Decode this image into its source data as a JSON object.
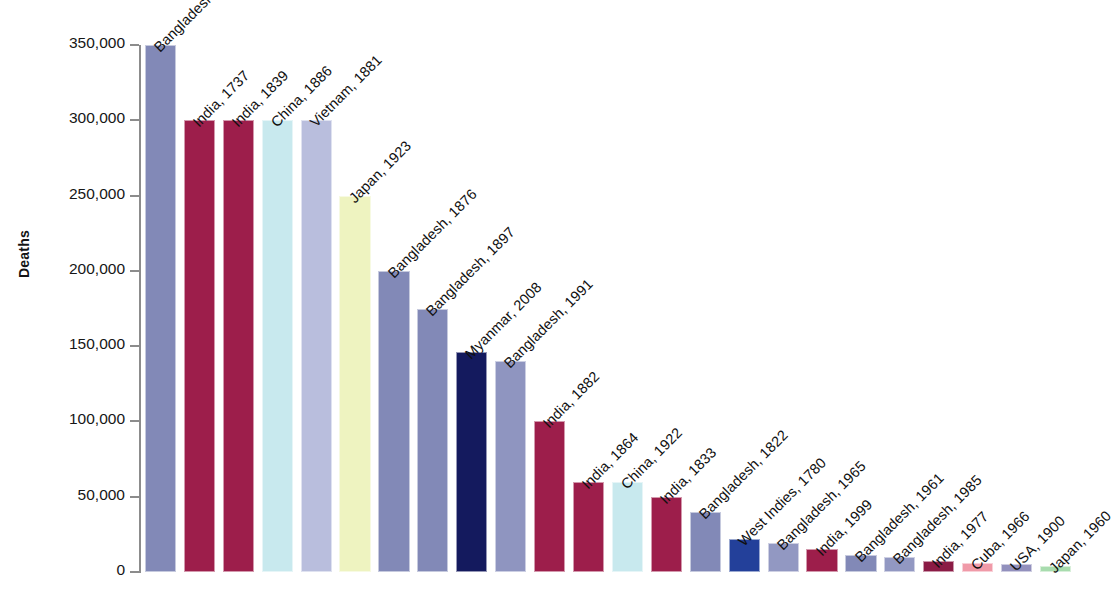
{
  "chart_data": {
    "type": "bar",
    "title": "",
    "subtitle": "",
    "xlabel": "",
    "ylabel": "Deaths",
    "ylim": [
      0,
      350000
    ],
    "ytick_values": [
      0,
      50000,
      100000,
      150000,
      200000,
      250000,
      300000,
      350000
    ],
    "ytick_labels": [
      "0",
      "50,000",
      "100,000",
      "150,000",
      "200,000",
      "250,000",
      "300,000",
      "350,000"
    ],
    "grid": false,
    "legend": "none",
    "categories": [
      "Bangladesh, 1970",
      "India, 1737",
      "India, 1839",
      "China, 1886",
      "Vietnam, 1881",
      "Japan, 1923",
      "Bangladesh, 1876",
      "Bangladesh, 1897",
      "Myanmar, 2008",
      "Bangladesh, 1991",
      "India, 1882",
      "India, 1864",
      "China, 1922",
      "India, 1833",
      "Bangladesh, 1822",
      "West Indies, 1780",
      "Bangladesh, 1965",
      "India, 1999",
      "Bangladesh, 1961",
      "Bangladesh, 1985",
      "India, 1977",
      "Cuba, 1966",
      "USA, 1900",
      "Japan, 1960"
    ],
    "values": [
      350000,
      300000,
      300000,
      300000,
      300000,
      250000,
      200000,
      175000,
      146000,
      140000,
      100000,
      60000,
      60000,
      50000,
      40000,
      22000,
      19000,
      15000,
      11500,
      10000,
      7000,
      6000,
      5000,
      4000
    ],
    "colors": [
      "#8289b7",
      "#9d1e4b",
      "#9d1e4b",
      "#c8e9ee",
      "#b9bedd",
      "#eef3c0",
      "#8289b7",
      "#8289b7",
      "#141a5e",
      "#8f95c0",
      "#9d1e4b",
      "#9d1e4b",
      "#c8e9ee",
      "#9d1e4b",
      "#8289b7",
      "#23409a",
      "#9298c2",
      "#9d1e4b",
      "#8289b7",
      "#9298c2",
      "#8b1b45",
      "#f09aa8",
      "#9290bd",
      "#a8dcae"
    ]
  }
}
